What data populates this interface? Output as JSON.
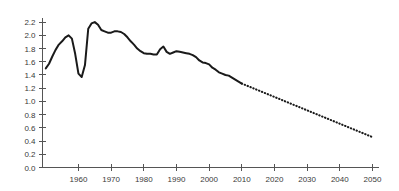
{
  "chart_data": {
    "type": "line",
    "title": "",
    "subtitle": "",
    "xlabel": "",
    "ylabel": "",
    "xlim": [
      1949,
      2052
    ],
    "ylim": [
      0.0,
      2.3
    ],
    "grid": false,
    "legend": null,
    "x_ticks": [
      1960,
      1970,
      1980,
      1990,
      2000,
      2010,
      2020,
      2030,
      2040,
      2050
    ],
    "x_tick_labels": [
      "1960",
      "1970",
      "1980",
      "1990",
      "2000",
      "2010",
      "2020",
      "2030",
      "2040",
      "2050"
    ],
    "y_ticks": [
      0.0,
      0.2,
      0.4,
      0.6,
      0.8,
      1.0,
      1.2,
      1.4,
      1.6,
      1.8,
      2.0,
      2.2
    ],
    "y_tick_labels": [
      "0.0",
      "0.2",
      "0.4",
      "0.6",
      "0.8",
      "1.0",
      "1.2",
      "1.4",
      "1.6",
      "1.8",
      "2.0",
      "2.2"
    ],
    "series": [
      {
        "name": "historical",
        "style": "solid",
        "x": [
          1950,
          1951,
          1952,
          1953,
          1954,
          1955,
          1956,
          1957,
          1958,
          1959,
          1960,
          1961,
          1962,
          1963,
          1964,
          1965,
          1966,
          1967,
          1968,
          1969,
          1970,
          1971,
          1972,
          1973,
          1974,
          1975,
          1976,
          1977,
          1978,
          1979,
          1980,
          1981,
          1982,
          1983,
          1984,
          1985,
          1986,
          1987,
          1988,
          1989,
          1990,
          1991,
          1992,
          1993,
          1994,
          1995,
          1996,
          1997,
          1998,
          1999,
          2000,
          2001,
          2002,
          2003,
          2004,
          2005,
          2006,
          2007,
          2008,
          2009,
          2010
        ],
        "y": [
          1.5,
          1.57,
          1.68,
          1.78,
          1.86,
          1.91,
          1.97,
          2.0,
          1.95,
          1.72,
          1.42,
          1.37,
          1.55,
          2.1,
          2.18,
          2.2,
          2.16,
          2.08,
          2.06,
          2.04,
          2.04,
          2.06,
          2.06,
          2.05,
          2.02,
          1.97,
          1.91,
          1.86,
          1.8,
          1.76,
          1.73,
          1.72,
          1.72,
          1.71,
          1.71,
          1.79,
          1.83,
          1.75,
          1.72,
          1.74,
          1.76,
          1.75,
          1.74,
          1.73,
          1.72,
          1.7,
          1.67,
          1.62,
          1.59,
          1.58,
          1.56,
          1.51,
          1.48,
          1.44,
          1.42,
          1.4,
          1.39,
          1.36,
          1.33,
          1.3,
          1.27
        ],
        "color": "#1a1a1a"
      },
      {
        "name": "projection",
        "style": "dotted",
        "x": [
          2010,
          2050
        ],
        "y": [
          1.27,
          0.46
        ],
        "color": "#1a1a1a"
      }
    ],
    "annotations": []
  },
  "axis": {
    "y_axis_name": "y-axis",
    "x_axis_name": "x-axis"
  }
}
